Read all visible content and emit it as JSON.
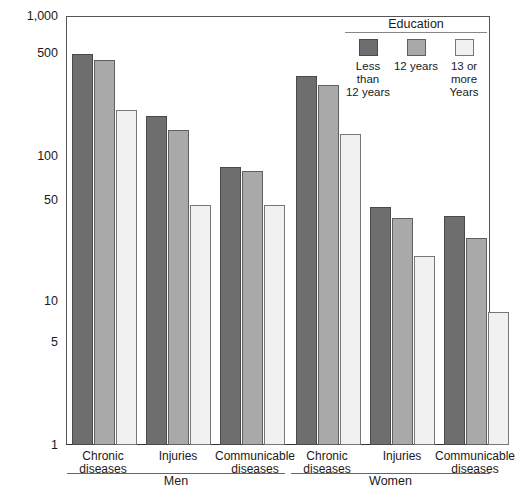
{
  "chart_data": {
    "type": "bar",
    "title": "",
    "xlabel": "",
    "ylabel": "",
    "scale": "log",
    "ylim": [
      1,
      1000
    ],
    "yticks": [
      1,
      5,
      10,
      50,
      100,
      500,
      1000
    ],
    "ytick_labels": [
      "1",
      "5",
      "10",
      "50",
      "100",
      "500",
      "1,000"
    ],
    "grid": false,
    "legend_title": "Education",
    "legend_position": "top-right",
    "groups": [
      "Men",
      "Women"
    ],
    "categories": [
      "Chronic diseases",
      "Injuries",
      "Communicable diseases"
    ],
    "series": [
      {
        "name": "Less than 12 years",
        "color": "#6e6e6e",
        "values": {
          "Men": [
            540,
            200,
            88
          ],
          "Women": [
            380,
            46,
            40
          ]
        }
      },
      {
        "name": "12 years",
        "color": "#a9a9a9",
        "values": {
          "Men": [
            490,
            160,
            83
          ],
          "Women": [
            330,
            39,
            28
          ]
        }
      },
      {
        "name": "13 or more Years",
        "color": "#f1f1f1",
        "values": {
          "Men": [
            220,
            48,
            48
          ],
          "Women": [
            150,
            21,
            8.5
          ]
        }
      }
    ]
  },
  "axis": {
    "ytick_labels": [
      "1,000",
      "500",
      "100",
      "50",
      "10",
      "5",
      "1"
    ]
  },
  "legend": {
    "title": "Education",
    "items": [
      {
        "label_line1": "Less than",
        "label_line2": "12 years",
        "swatch": "dark-gray-swatch"
      },
      {
        "label_line1": "12 years",
        "label_line2": "",
        "swatch": "medium-gray-swatch"
      },
      {
        "label_line1": "13 or more",
        "label_line2": "Years",
        "swatch": "light-gray-swatch"
      }
    ]
  },
  "categories": {
    "men": [
      {
        "line1": "Chronic",
        "line2": "diseases"
      },
      {
        "line1": "Injuries",
        "line2": ""
      },
      {
        "line1": "Communicable",
        "line2": "diseases"
      }
    ],
    "women": [
      {
        "line1": "Chronic",
        "line2": "diseases"
      },
      {
        "line1": "Injuries",
        "line2": ""
      },
      {
        "line1": "Communicable",
        "line2": "diseases"
      }
    ]
  },
  "groups": {
    "men_label": "Men",
    "women_label": "Women"
  },
  "colors": {
    "series_0": "#6e6e6e",
    "series_1": "#a9a9a9",
    "series_2": "#f1f1f1",
    "axis": "#555555"
  }
}
